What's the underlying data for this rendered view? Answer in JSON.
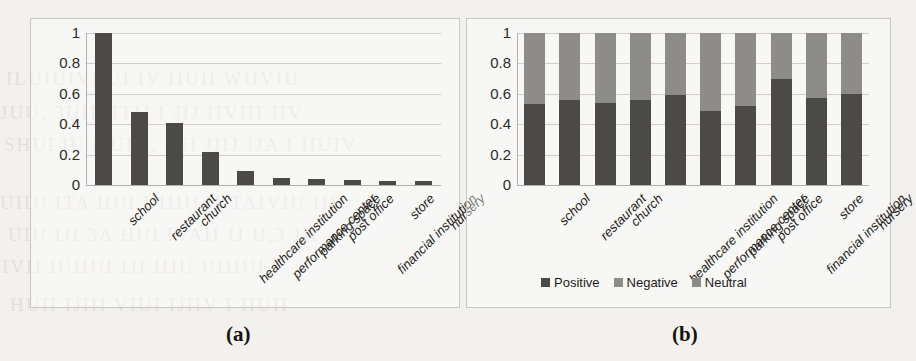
{
  "figure": {
    "background_color": "#f2f1ee",
    "panel_border_color": "#c9c6c0",
    "captions": {
      "a": "(a)",
      "b": "(b)"
    }
  },
  "colors": {
    "positive": "#4c4a47",
    "negative": "#8e8c89",
    "neutral": "#8e8c89",
    "gridline": "#cfcdc7",
    "axis": "#b3b0aa",
    "text": "#1f1d1a"
  },
  "ghost_text": {
    "line1": "ILUIUIVI UI IV IIUII WIIVIU",
    "line2": "JUU, 3UII, ITIJ I JIJ IIVIII IIV",
    "line3": "SHULIU (JUIII, JUI JIIJ IJA I IIUIV",
    "line4": "UIIU ITA HUI UIIIU UITAIVIU IIV",
    "line5": "UIU IJI 3A HUI IVAII IJ U,3 JII",
    "line6": "IVII IUIIUI IJI IIIU UIIIUI",
    "line7": "HUII IJIII VIUI IJIIV I IIUII"
  },
  "panel_a": {
    "name": "frequency-bar-chart"
  },
  "panel_b": {
    "name": "sentiment-stacked-bar-chart",
    "legend": {
      "position": "bottom-center",
      "entries": [
        {
          "label": "Positive",
          "color": "#4c4a47"
        },
        {
          "label": "Negative",
          "color": "#8e8c89"
        },
        {
          "label": "Neutral",
          "color": "#8e8c89"
        }
      ]
    }
  },
  "chart_data": [
    {
      "type": "bar",
      "panel": "(a)",
      "title": "",
      "xlabel": "",
      "ylabel": "",
      "ylim": [
        0,
        1
      ],
      "yticks": [
        "0",
        "0.2",
        "0.4",
        "0.6",
        "0.8",
        "1"
      ],
      "ytick_values": [
        0,
        0.2,
        0.4,
        0.6,
        0.8,
        1
      ],
      "grid": true,
      "legend": false,
      "categories": [
        "school",
        "restaurant",
        "church",
        "healthcare institution",
        "performance center",
        "parking space",
        "post office",
        "financial institution",
        "store",
        "nursery"
      ],
      "values": [
        1.0,
        0.48,
        0.41,
        0.22,
        0.09,
        0.045,
        0.04,
        0.035,
        0.025,
        0.025
      ],
      "bar_color": "#4c4a47"
    },
    {
      "type": "bar",
      "subtype": "stacked",
      "panel": "(b)",
      "title": "",
      "xlabel": "",
      "ylabel": "",
      "ylim": [
        0,
        1
      ],
      "yticks": [
        "0",
        "0.2",
        "0.4",
        "0.6",
        "0.8",
        "1"
      ],
      "ytick_values": [
        0,
        0.2,
        0.4,
        0.6,
        0.8,
        1
      ],
      "grid": true,
      "legend": true,
      "legend_position": "bottom",
      "categories": [
        "school",
        "restaurant",
        "church",
        "healthcare institution",
        "performance center",
        "parking space",
        "post office",
        "financial institution",
        "store",
        "nursery"
      ],
      "series": [
        {
          "name": "Positive",
          "color": "#4c4a47",
          "values": [
            0.53,
            0.56,
            0.54,
            0.56,
            0.59,
            0.49,
            0.52,
            0.7,
            0.57,
            0.6
          ]
        },
        {
          "name": "Negative",
          "color": "#8e8c89",
          "values": [
            0.24,
            0.22,
            0.23,
            0.22,
            0.21,
            0.26,
            0.24,
            0.15,
            0.22,
            0.2
          ]
        },
        {
          "name": "Neutral",
          "color": "#8e8c89",
          "values": [
            0.23,
            0.22,
            0.23,
            0.22,
            0.2,
            0.25,
            0.24,
            0.15,
            0.21,
            0.2
          ]
        }
      ]
    }
  ]
}
